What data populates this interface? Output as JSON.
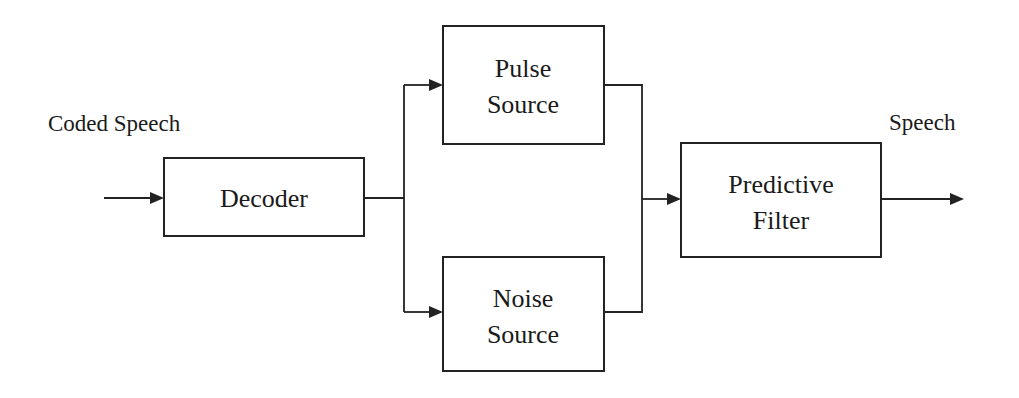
{
  "diagram": {
    "type": "block-diagram",
    "input_label": "Coded Speech",
    "output_label": "Speech",
    "blocks": [
      {
        "id": "decoder",
        "lines": [
          "Decoder"
        ]
      },
      {
        "id": "pulse",
        "lines": [
          "Pulse",
          "Source"
        ]
      },
      {
        "id": "noise",
        "lines": [
          "Noise",
          "Source"
        ]
      },
      {
        "id": "filter",
        "lines": [
          "Predictive",
          "Filter"
        ]
      }
    ],
    "edges": [
      {
        "from": "input",
        "to": "decoder"
      },
      {
        "from": "decoder",
        "to": "pulse"
      },
      {
        "from": "decoder",
        "to": "noise"
      },
      {
        "from": "pulse",
        "to": "filter"
      },
      {
        "from": "noise",
        "to": "filter"
      },
      {
        "from": "filter",
        "to": "output"
      }
    ]
  }
}
